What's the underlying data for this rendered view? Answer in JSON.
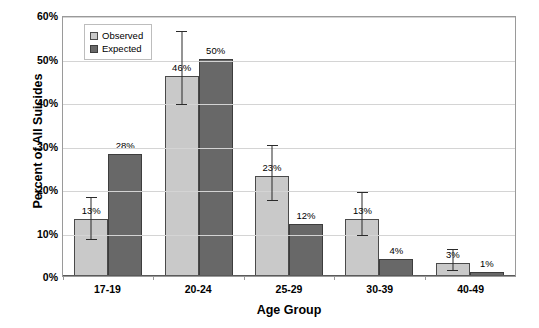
{
  "chart_data": {
    "type": "bar",
    "title": "",
    "xlabel": "Age Group",
    "ylabel": "Percent of All Suicides",
    "categories": [
      "17-19",
      "20-24",
      "25-29",
      "30-39",
      "40-49"
    ],
    "ylim": [
      0,
      60
    ],
    "ytick_labels": [
      "0%",
      "10%",
      "20%",
      "30%",
      "40%",
      "50%",
      "60%"
    ],
    "ytick_values": [
      0,
      10,
      20,
      30,
      40,
      50,
      60
    ],
    "grid": true,
    "legend_position": "top-left",
    "series": [
      {
        "name": "Observed",
        "color": "#c9c9c9",
        "values": [
          13,
          46,
          23,
          13,
          3
        ],
        "value_labels": [
          "13%",
          "46%",
          "23%",
          "13%",
          "3%"
        ],
        "error_low": [
          8,
          39,
          17,
          9,
          1
        ],
        "error_high": [
          18,
          56,
          30,
          19,
          6
        ]
      },
      {
        "name": "Expected",
        "color": "#686868",
        "values": [
          28,
          50,
          12,
          4,
          1
        ],
        "value_labels": [
          "28%",
          "50%",
          "12%",
          "4%",
          "1%"
        ],
        "error_low": null,
        "error_high": null
      }
    ]
  },
  "legend": {
    "items": [
      {
        "label": "Observed"
      },
      {
        "label": "Expected"
      }
    ]
  },
  "axes": {
    "y_title": "Percent of All Suicides",
    "x_title": "Age Group"
  }
}
